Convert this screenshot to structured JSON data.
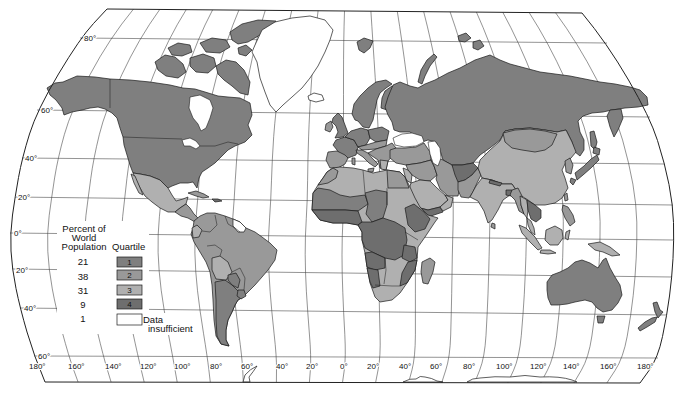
{
  "graticule": {
    "latitude_labels": [
      "80°",
      "60°",
      "40°",
      "20°",
      "0°",
      "20°",
      "40°",
      "60°"
    ],
    "longitude_labels": [
      "180°",
      "160°",
      "140°",
      "120°",
      "100°",
      "80°",
      "60°",
      "40°",
      "20°",
      "0°",
      "20°",
      "40°",
      "60°",
      "80°",
      "100°",
      "120°",
      "140°",
      "160°",
      "180°"
    ]
  },
  "legend": {
    "percent_header": [
      "Percent of",
      "World",
      "Population"
    ],
    "quartile_header": "Quartile",
    "rows": [
      {
        "percent": "21",
        "quartile": "1",
        "color": "#7f7f7f"
      },
      {
        "percent": "38",
        "quartile": "2",
        "color": "#999999"
      },
      {
        "percent": "31",
        "quartile": "3",
        "color": "#b0b0b0"
      },
      {
        "percent": "9",
        "quartile": "4",
        "color": "#6e6e6e"
      },
      {
        "percent": "1",
        "quartile": "",
        "label": [
          "Data",
          "insufficient"
        ],
        "color": "#ffffff"
      }
    ]
  },
  "map_colors": {
    "outline": "#1a1a1a",
    "grid": "#3a3a3a",
    "water": "#ffffff"
  }
}
